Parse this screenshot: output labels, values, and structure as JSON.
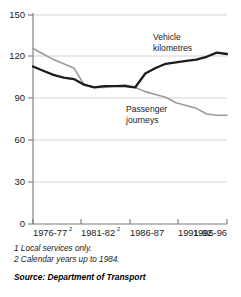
{
  "chart_data": {
    "type": "line",
    "title": "",
    "xlabel": "",
    "ylabel": "",
    "grid": "horizontal",
    "legend": "inline-annotations",
    "ylim": [
      0,
      150
    ],
    "yticks": [
      0,
      30,
      60,
      90,
      120,
      150
    ],
    "ytick_labels": [
      "0",
      "30",
      "60",
      "90",
      "120",
      "150"
    ],
    "x": [
      "1976-77",
      "1977-78",
      "1978-79",
      "1979-80",
      "1980-81",
      "1981-82",
      "1982-83",
      "1983-84",
      "1984-85",
      "1985-86",
      "1986-87",
      "1987-88",
      "1988-89",
      "1989-90",
      "1990-91",
      "1991-92",
      "1992-93",
      "1993-94",
      "1994-95",
      "1995-96"
    ],
    "xtick_labels": [
      "1976-77",
      "1981-82",
      "1986-87",
      "1991-92",
      "1995-96"
    ],
    "xtick_superscripts": [
      "2",
      "2",
      "",
      "",
      ""
    ],
    "series": [
      {
        "name": "Vehicle kilometres",
        "color": "#1c1c1c",
        "values": [
          113,
          110,
          107,
          105,
          104,
          100,
          98,
          99,
          99,
          99,
          98,
          108,
          112,
          115,
          116,
          117,
          118,
          120,
          123,
          122
        ]
      },
      {
        "name": "Passenger journeys",
        "color": "#9a9a9a",
        "values": [
          126,
          122,
          118,
          115,
          112,
          100,
          98,
          98,
          99,
          100,
          98,
          95,
          93,
          91,
          87,
          85,
          83,
          79,
          78,
          78
        ]
      }
    ],
    "annotations": [
      {
        "name": "Vehicle kilometres",
        "line1": "Vehicle",
        "line2": "kilometres"
      },
      {
        "name": "Passenger journeys",
        "line1": "Passenger",
        "line2": "journeys"
      }
    ]
  },
  "footnotes": [
    "1 Local services only.",
    "2 Calendar years up to 1984."
  ],
  "source": "Source: Department of Transport"
}
